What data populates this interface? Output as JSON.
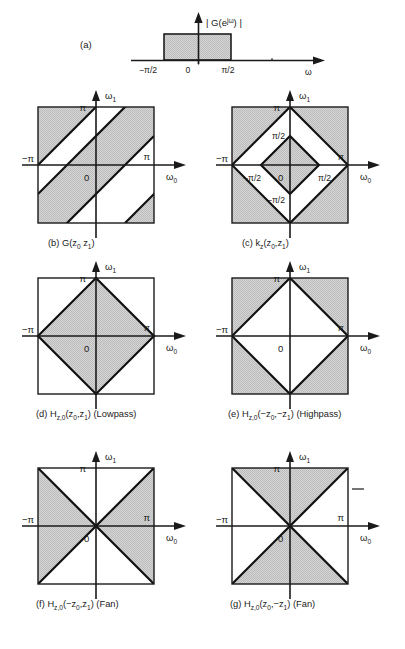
{
  "figure": {
    "shade_color": "#c9c9c9",
    "line_color": "#111111",
    "background": "#ffffff"
  },
  "panels": [
    {
      "id": "a",
      "tag": "(a)",
      "type": "1d-magnitude-response",
      "ylabel": "| G(e^{jw}) |",
      "ylabel_parts": {
        "pre": "| G(e",
        "sup": "jω",
        "post": ") |"
      },
      "xlabel": "ω",
      "ticks": [
        {
          "label": "−π/2",
          "value": -1.5708
        },
        {
          "label": "0",
          "value": 0
        },
        {
          "label": "π/2",
          "value": 1.5708
        }
      ],
      "band": {
        "from": -1.5708,
        "to": 1.5708,
        "height": 1
      },
      "caption": ""
    },
    {
      "id": "b",
      "tag": "(b)",
      "caption_main": "G(z",
      "caption_sub1": "0",
      "caption_mid": " z",
      "caption_sub2": "1",
      "caption_end": ")",
      "caption_full": "(b)  G(z0 z1)",
      "type": "2d-diagonal-bands",
      "xlabel": "ω",
      "xlabel_sub": "0",
      "ylabel": "ω",
      "ylabel_sub": "1",
      "axis_labels": {
        "x_pos": "π",
        "x_neg": "−π",
        "y_pos": "π",
        "origin": "0"
      },
      "region_description": "Alternating diagonal stripes of slope -1 crossing the square"
    },
    {
      "id": "c",
      "tag": "(c)",
      "caption_main": "k",
      "caption_subz": "z",
      "caption_args": "(z",
      "caption_sub1": "0",
      "caption_comma": ",z",
      "caption_sub2": "1",
      "caption_end": ")",
      "caption_full": "(c)  kz(z0,z1)",
      "type": "2d-diamond-plus-corners",
      "xlabel": "ω",
      "xlabel_sub": "0",
      "ylabel": "ω",
      "ylabel_sub": "1",
      "axis_labels": {
        "x_pos": "π",
        "x_neg": "−π",
        "y_pos": "π",
        "origin": "0",
        "x_half_pos": "π/2",
        "x_half_neg": "−π/2",
        "y_half_pos": "π/2",
        "y_half_neg": "−π/2"
      },
      "region_description": "Central diamond of radius pi/2 shaded plus four shaded corner triangles"
    },
    {
      "id": "d",
      "tag": "(d)",
      "caption_main": "H",
      "caption_subz": "z,0",
      "caption_args": "(z",
      "caption_sub1": "0",
      "caption_comma": ",z",
      "caption_sub2": "1",
      "caption_end": ")",
      "caption_suffix": "(Lowpass)",
      "caption_full": "(d)  Hz,0(z0,z1) (Lowpass)",
      "type": "2d-diamond-filled",
      "xlabel": "ω",
      "xlabel_sub": "0",
      "ylabel": "ω",
      "ylabel_sub": "1",
      "axis_labels": {
        "x_pos": "π",
        "x_neg": "−π",
        "y_pos": "π",
        "origin": "0"
      },
      "region_description": "Filled diamond with vertices at (+-pi,0) and (0,+-pi)"
    },
    {
      "id": "e",
      "tag": "(e)",
      "caption_main": "H",
      "caption_subz": "z,0",
      "caption_args": "(−z",
      "caption_sub1": "0",
      "caption_comma": ",−z",
      "caption_sub2": "1",
      "caption_end": ")",
      "caption_suffix": "(Highpass)",
      "caption_full": "(e)  Hz,0(−z0,−z1) (Highpass)",
      "type": "2d-diamond-complement",
      "xlabel": "ω",
      "xlabel_sub": "0",
      "ylabel": "ω",
      "ylabel_sub": "1",
      "axis_labels": {
        "x_pos": "π",
        "x_neg": "−π",
        "y_pos": "π",
        "origin": "0"
      },
      "region_description": "Four corner triangles shaded, central diamond white"
    },
    {
      "id": "f",
      "tag": "(f)",
      "caption_main": "H",
      "caption_subz": "z,0",
      "caption_args": "(−z",
      "caption_sub1": "0",
      "caption_comma": ",z",
      "caption_sub2": "1",
      "caption_end": ")",
      "caption_suffix": "(Fan)",
      "caption_full": "(f)  Hz,0(−z0,z1) (Fan)",
      "type": "2d-fan-horizontal",
      "xlabel": "ω",
      "xlabel_sub": "0",
      "ylabel": "ω",
      "ylabel_sub": "1",
      "axis_labels": {
        "x_pos": "π",
        "x_neg": "−π",
        "y_pos": "π",
        "origin": "0"
      },
      "region_description": "Left and right bowtie triangles shaded"
    },
    {
      "id": "g",
      "tag": "(g)",
      "caption_main": "H",
      "caption_subz": "z,0",
      "caption_args": "(z",
      "caption_sub1": "0",
      "caption_comma": ",−z",
      "caption_sub2": "1",
      "caption_end": ")",
      "caption_suffix": "(Fan)",
      "caption_full": "(g)  Hz,0(z0,−z1) (Fan)",
      "type": "2d-fan-vertical",
      "xlabel": "ω",
      "xlabel_sub": "0",
      "ylabel": "ω",
      "ylabel_sub": "1",
      "axis_labels": {
        "x_pos": "π",
        "x_neg": "−π",
        "y_pos": "π",
        "origin": "0"
      },
      "region_description": "Top and bottom bowtie triangles shaded"
    }
  ]
}
